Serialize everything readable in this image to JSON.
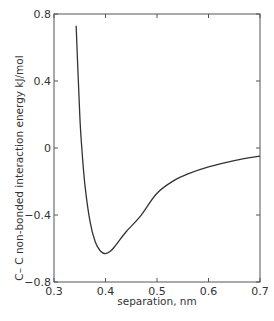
{
  "chart_data": {
    "type": "line",
    "title": "",
    "xlabel": "separation, nm",
    "ylabel": "C– C non-bonded interaction energy kJ/mol",
    "xlim": [
      0.3,
      0.7
    ],
    "ylim": [
      -0.8,
      0.8
    ],
    "x_ticks": [
      "0.3",
      "0.4",
      "0.5",
      "0.6",
      "0.7"
    ],
    "y_ticks": [
      "0.8",
      "0.4",
      "0",
      "−0.4",
      "−0.8"
    ],
    "grid": false,
    "legend": null,
    "series": [
      {
        "name": "C–C potential",
        "color": "#333333",
        "x": [
          0.343,
          0.35,
          0.354,
          0.36,
          0.37,
          0.38,
          0.39,
          0.4,
          0.41,
          0.42,
          0.44,
          0.467,
          0.5,
          0.535,
          0.56,
          0.6,
          0.65,
          0.7
        ],
        "y": [
          0.73,
          0.2,
          0.0,
          -0.22,
          -0.44,
          -0.56,
          -0.615,
          -0.63,
          -0.615,
          -0.58,
          -0.5,
          -0.41,
          -0.27,
          -0.19,
          -0.155,
          -0.113,
          -0.075,
          -0.048
        ]
      }
    ]
  },
  "labels": {
    "x_axis": "separation, nm",
    "y_axis": "C– C non-bonded interaction energy kJ/mol"
  }
}
